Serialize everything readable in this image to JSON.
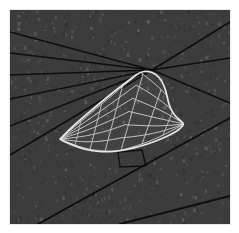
{
  "figure": {
    "title": "",
    "width": 239,
    "height": 233,
    "page_background": "#ffffff"
  },
  "canvas": {
    "name": "3d-surface-mesh-viewport",
    "x": 10,
    "y": 10,
    "width": 220,
    "height": 214,
    "background_color": "#3c3c3c",
    "background_noise_color": "#454545",
    "border_color": "#e8e8e8"
  },
  "chart_data": {
    "type": "scatter",
    "title": "",
    "subtitle": "",
    "xlabel": "",
    "ylabel": "",
    "legend": [],
    "grid": false,
    "background_plane": {
      "name": "ground-plane",
      "fill": "#3c3c3c",
      "ruling_line_color": "#0e0e0e",
      "ruling_line_width": 1.6,
      "left_family_count": 6,
      "right_family_count": 3,
      "vanishing_point": [
        152,
        70
      ],
      "left_family_lines": [
        {
          "x1": 10,
          "y1": 32,
          "x2": 152,
          "y2": 70
        },
        {
          "x1": 10,
          "y1": 53,
          "x2": 152,
          "y2": 70
        },
        {
          "x1": 10,
          "y1": 75,
          "x2": 152,
          "y2": 70
        },
        {
          "x1": 10,
          "y1": 99,
          "x2": 152,
          "y2": 70
        },
        {
          "x1": 10,
          "y1": 126,
          "x2": 152,
          "y2": 70
        },
        {
          "x1": 10,
          "y1": 155,
          "x2": 152,
          "y2": 70
        }
      ],
      "right_family_lines": [
        {
          "x1": 152,
          "y1": 70,
          "x2": 230,
          "y2": 22
        },
        {
          "x1": 152,
          "y1": 70,
          "x2": 230,
          "y2": 58
        },
        {
          "x1": 152,
          "y1": 70,
          "x2": 230,
          "y2": 103
        }
      ],
      "foreground_edge_lines": [
        {
          "x1": 38,
          "y1": 224,
          "x2": 230,
          "y2": 118,
          "name": "near-plane-edge"
        },
        {
          "x1": 120,
          "y1": 224,
          "x2": 230,
          "y2": 196,
          "name": "lower-right-edge"
        }
      ],
      "notch_polygon": [
        [
          118,
          152
        ],
        [
          142,
          150
        ],
        [
          146,
          166
        ],
        [
          120,
          167
        ]
      ]
    },
    "surface_patch": {
      "name": "wing-surface-mesh",
      "outline_color": "#e6e6e6",
      "mesh_color": "#c8c8c8",
      "outline_width": 1.7,
      "mesh_width": 1.0,
      "fill": "rgba(255,255,255,0.03)",
      "u_divisions": 7,
      "v_divisions": 6,
      "boundary_points": [
        [
          60,
          139
        ],
        [
          69,
          130
        ],
        [
          80,
          120
        ],
        [
          93,
          109
        ],
        [
          106,
          98
        ],
        [
          120,
          87
        ],
        [
          132,
          78
        ],
        [
          140,
          72
        ],
        [
          148,
          71
        ],
        [
          156,
          74
        ],
        [
          162,
          81
        ],
        [
          166,
          91
        ],
        [
          168,
          101
        ],
        [
          171,
          110
        ],
        [
          176,
          117
        ],
        [
          181,
          121
        ],
        [
          184,
          124
        ],
        [
          180,
          129
        ],
        [
          172,
          134
        ],
        [
          161,
          139
        ],
        [
          148,
          144
        ],
        [
          134,
          148
        ],
        [
          120,
          151
        ],
        [
          106,
          152
        ],
        [
          92,
          151
        ],
        [
          80,
          148
        ],
        [
          70,
          144
        ],
        [
          63,
          141
        ]
      ],
      "leading_tip": [
        60,
        139
      ],
      "apex": [
        140,
        72
      ],
      "trailing_tip": [
        184,
        124
      ]
    }
  },
  "icons": {
    "none": ""
  }
}
